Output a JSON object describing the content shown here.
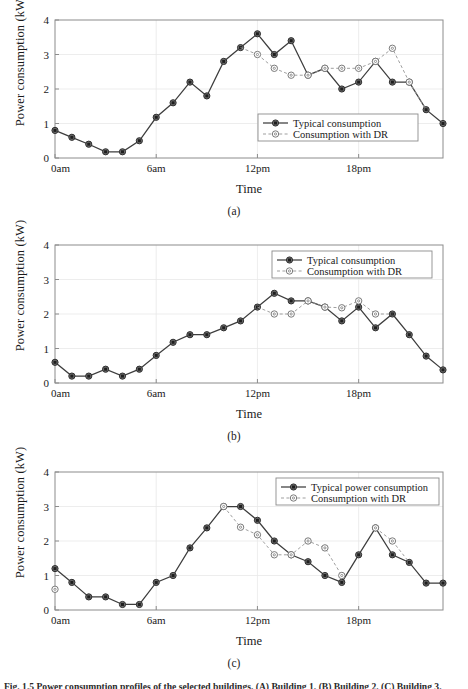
{
  "figure": {
    "caption": "Fig. 1.5 Power consumption profiles of the selected buildings. (A) Building 1. (B) Building 2. (C) Building 3."
  },
  "axes": {
    "ylabel": "Power consumption (kW)",
    "xlabel": "Time",
    "yticks": [
      "0",
      "1",
      "2",
      "3",
      "4"
    ],
    "xticks": [
      "0am",
      "6am",
      "12pm",
      "18pm"
    ],
    "xtick_hours": [
      0,
      6,
      12,
      18
    ]
  },
  "panels": [
    {
      "id": "a",
      "caption": "(a)",
      "legend_pos": "inside-right-lower"
    },
    {
      "id": "b",
      "caption": "(b)",
      "legend_pos": "inside-right-upper"
    },
    {
      "id": "c",
      "caption": "(c)",
      "legend_pos": "inside-right-upper"
    }
  ],
  "colors": {
    "typical": "#3d3d3d",
    "dr": "#9a9a9a",
    "axis": "#8c8c8c",
    "grid": "#e8e8e8",
    "background": "#ffffff"
  },
  "chart_data": [
    {
      "type": "line",
      "panel": "(a)",
      "title": "",
      "xlabel": "Time",
      "ylabel": "Power consumption (kW)",
      "xlim": [
        0,
        23
      ],
      "ylim": [
        0,
        4
      ],
      "grid": true,
      "legend_position": "lower right inside axes",
      "x": [
        0,
        1,
        2,
        3,
        4,
        5,
        6,
        7,
        8,
        9,
        10,
        11,
        12,
        13,
        14,
        15,
        16,
        17,
        18,
        19,
        20,
        21,
        22,
        23
      ],
      "series": [
        {
          "name": "Typical consumption",
          "marker": "filled-square",
          "linestyle": "solid",
          "values": [
            0.8,
            0.6,
            0.4,
            0.18,
            0.18,
            0.5,
            1.18,
            1.6,
            2.2,
            1.8,
            2.8,
            3.2,
            3.6,
            3.0,
            3.4,
            2.4,
            2.6,
            2.0,
            2.2,
            2.8,
            2.2,
            2.2,
            1.4,
            1.0
          ]
        },
        {
          "name": "Consumption with DR",
          "marker": "open-circle",
          "linestyle": "dashed",
          "values": [
            null,
            null,
            null,
            null,
            null,
            null,
            null,
            null,
            null,
            null,
            null,
            null,
            3.0,
            2.6,
            2.4,
            2.4,
            2.6,
            2.6,
            2.6,
            2.8,
            3.18,
            2.2,
            null,
            null
          ]
        }
      ]
    },
    {
      "type": "line",
      "panel": "(b)",
      "title": "",
      "xlabel": "Time",
      "ylabel": "Power consumption (kW)",
      "xlim": [
        0,
        23
      ],
      "ylim": [
        0,
        4
      ],
      "grid": true,
      "legend_position": "upper right inside axes",
      "x": [
        0,
        1,
        2,
        3,
        4,
        5,
        6,
        7,
        8,
        9,
        10,
        11,
        12,
        13,
        14,
        15,
        16,
        17,
        18,
        19,
        20,
        21,
        22,
        23
      ],
      "series": [
        {
          "name": "Typical consumption",
          "marker": "filled-square",
          "linestyle": "solid",
          "values": [
            0.6,
            0.2,
            0.2,
            0.4,
            0.2,
            0.4,
            0.8,
            1.18,
            1.4,
            1.4,
            1.6,
            1.8,
            2.2,
            2.6,
            2.38,
            2.38,
            2.2,
            1.8,
            2.2,
            1.6,
            2.0,
            1.4,
            0.78,
            0.38
          ]
        },
        {
          "name": "Consumption with DR",
          "marker": "open-circle",
          "linestyle": "dashed",
          "values": [
            null,
            null,
            null,
            null,
            null,
            null,
            null,
            null,
            null,
            null,
            null,
            null,
            null,
            2.0,
            2.0,
            2.38,
            2.2,
            2.18,
            2.38,
            2.0,
            null,
            null,
            null,
            null
          ]
        }
      ]
    },
    {
      "type": "line",
      "panel": "(c)",
      "title": "",
      "xlabel": "Time",
      "ylabel": "Power consumption (kW)",
      "xlim": [
        0,
        23
      ],
      "ylim": [
        0,
        4
      ],
      "grid": true,
      "legend_position": "upper right inside axes",
      "x": [
        0,
        1,
        2,
        3,
        4,
        5,
        6,
        7,
        8,
        9,
        10,
        11,
        12,
        13,
        14,
        15,
        16,
        17,
        18,
        19,
        20,
        21,
        22,
        23
      ],
      "series": [
        {
          "name": "Typical power consumption",
          "marker": "filled-square",
          "linestyle": "solid",
          "values": [
            1.2,
            0.8,
            0.38,
            0.38,
            0.16,
            0.16,
            0.8,
            1.0,
            1.8,
            2.38,
            3.0,
            3.0,
            2.6,
            2.0,
            1.6,
            1.4,
            1.0,
            0.8,
            1.6,
            2.38,
            1.6,
            1.38,
            0.78,
            0.78
          ]
        },
        {
          "name": "Consumption with DR",
          "marker": "open-circle",
          "linestyle": "dashed",
          "values": [
            0.6,
            null,
            null,
            null,
            null,
            null,
            null,
            null,
            null,
            null,
            3.0,
            2.4,
            2.18,
            1.6,
            1.6,
            2.0,
            1.8,
            1.0,
            null,
            2.38,
            2.0,
            null,
            null,
            null
          ]
        }
      ]
    }
  ],
  "legend_labels": {
    "typical_a": "Typical consumption",
    "dr_a": "Consumption with DR",
    "typical_b": "Typical consumption",
    "dr_b": "Consumption with DR",
    "typical_c": "Typical power consumption",
    "dr_c": "Consumption with DR"
  }
}
